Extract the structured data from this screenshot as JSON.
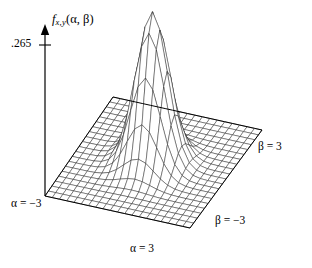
{
  "figure": {
    "title": "",
    "background_color": "#ffffff",
    "line_color": "#000000",
    "width": 312,
    "height": 268
  },
  "labels": {
    "z_axis_fn": "f",
    "z_axis_sub": "x,y",
    "z_axis_args": "(α, β)",
    "z_axis_full": "f_{x,y}(α, β)",
    "z_tick_value": ".265",
    "alpha_min": "α = −3",
    "alpha_max": "α = 3",
    "beta_min": "β = −3",
    "beta_max": "β = 3"
  },
  "chart_data": {
    "type": "surface",
    "title": "",
    "xlabel": "α",
    "ylabel": "β",
    "zlabel": "f_{x,y}(α, β)",
    "xlim": [
      -3,
      3
    ],
    "ylim": [
      -3,
      3
    ],
    "zlim": [
      0,
      0.265
    ],
    "z_ticks": [
      0.265
    ],
    "z_tick_labels": [
      ".265"
    ],
    "grid": true,
    "legend": false,
    "mesh_n": 21,
    "projection": "isometric-wireframe",
    "surface_function": "bivariate_normal_correlated",
    "peak_value": 0.265,
    "peak_x": 0,
    "peak_y": 0,
    "sigma_x": 0.62,
    "sigma_y": 0.62,
    "rho": 0.0,
    "z_values_note": "z = 0.265 * exp(-((alpha^2 + beta^2) / (2 * 0.62^2)))",
    "sample_grid_alpha": [
      -3,
      -2.7,
      -2.4,
      -2.1,
      -1.8,
      -1.5,
      -1.2,
      -0.9,
      -0.6,
      -0.3,
      0,
      0.3,
      0.6,
      0.9,
      1.2,
      1.5,
      1.8,
      2.1,
      2.4,
      2.7,
      3
    ],
    "sample_grid_beta": [
      -3,
      -2.7,
      -2.4,
      -2.1,
      -1.8,
      -1.5,
      -1.2,
      -0.9,
      -0.6,
      -0.3,
      0,
      0.3,
      0.6,
      0.9,
      1.2,
      1.5,
      1.8,
      2.1,
      2.4,
      2.7,
      3
    ],
    "sample_profile_beta0": [
      0.0,
      0.0,
      0.0001,
      0.0008,
      0.004,
      0.0159,
      0.0498,
      0.1,
      0.1775,
      0.2353,
      0.265,
      0.2353,
      0.1775,
      0.1,
      0.0498,
      0.0159,
      0.004,
      0.0008,
      0.0001,
      0.0,
      0.0
    ]
  },
  "geometry": {
    "origin_x": 45,
    "origin_y": 196,
    "right_corner_x": 262,
    "right_corner_y": 130,
    "front_corner_x": 190,
    "front_corner_y": 228,
    "back_corner_x": 113,
    "back_corner_y": 97,
    "z_axis_top_y": 25,
    "z_tick_y": 45
  }
}
